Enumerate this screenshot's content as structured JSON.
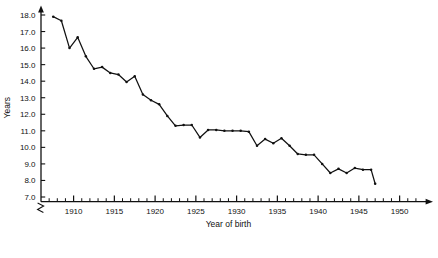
{
  "chart_data": {
    "type": "line",
    "title": "",
    "xlabel": "Year of birth",
    "ylabel": "Years",
    "xlim": [
      1906.0,
      1952.5
    ],
    "ylim": [
      6.6,
      18.6
    ],
    "grid": false,
    "legend": "none",
    "axis_break": {
      "axis": "y",
      "note": "break symbol below 7.0 near origin"
    },
    "xticks_major": [
      1910,
      1915,
      1920,
      1925,
      1930,
      1935,
      1940,
      1945,
      1950
    ],
    "xtick_labels": [
      "1910",
      "1915",
      "1920",
      "1925",
      "1930",
      "1935",
      "1940",
      "1945",
      "1950"
    ],
    "xticks_minor_step": 1,
    "yticks": [
      7.0,
      8.0,
      9.0,
      10.0,
      11.0,
      12.0,
      13.0,
      14.0,
      15.0,
      16.0,
      17.0,
      18.0
    ],
    "ytick_labels": [
      "7.0",
      "8.0",
      "9.0",
      "10.0",
      "11.0",
      "12.0",
      "13.0",
      "14.0",
      "15.0",
      "16.0",
      "17.0",
      "18.0"
    ],
    "marker": "dot",
    "line_color": "#111111",
    "series": [
      {
        "name": "Age at event by year of birth",
        "x": [
          1907.5,
          1908.5,
          1909.5,
          1910.5,
          1911.5,
          1912.5,
          1913.5,
          1914.5,
          1915.5,
          1916.5,
          1917.5,
          1918.5,
          1919.5,
          1920.5,
          1921.5,
          1922.5,
          1923.5,
          1924.5,
          1925.5,
          1926.5,
          1927.5,
          1928.5,
          1929.5,
          1930.5,
          1931.5,
          1932.5,
          1933.5,
          1934.5,
          1935.5,
          1936.5,
          1937.5,
          1938.5,
          1939.5,
          1940.5,
          1941.5,
          1942.5,
          1943.5,
          1944.5,
          1945.5,
          1946.5,
          1947.0
        ],
        "y": [
          17.9,
          17.65,
          16.0,
          16.65,
          15.5,
          14.75,
          14.85,
          14.5,
          14.4,
          13.95,
          14.3,
          13.2,
          12.85,
          12.6,
          11.9,
          11.3,
          11.35,
          11.35,
          10.6,
          11.05,
          11.05,
          11.0,
          11.0,
          11.0,
          10.95,
          10.1,
          10.5,
          10.25,
          10.55,
          10.1,
          9.6,
          9.55,
          9.55,
          9.0,
          8.45,
          8.7,
          8.45,
          8.75,
          8.65,
          8.65,
          7.8
        ]
      }
    ]
  },
  "axes": {
    "y_axis_name": "Years",
    "x_axis_name": "Year of birth"
  }
}
